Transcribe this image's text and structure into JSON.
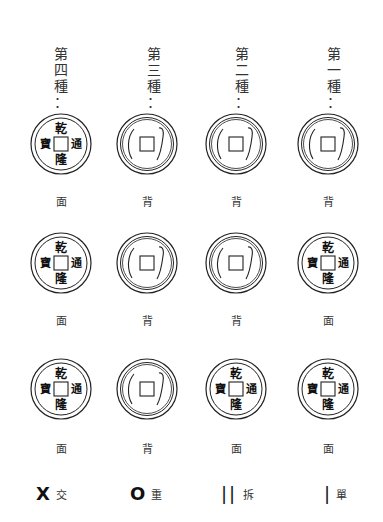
{
  "headers": [
    {
      "label": "第四種：",
      "chars": [
        "第",
        "四",
        "種",
        "："
      ]
    },
    {
      "label": "第三種：",
      "chars": [
        "第",
        "三",
        "種",
        "："
      ]
    },
    {
      "label": "第二種：",
      "chars": [
        "第",
        "二",
        "種",
        "："
      ]
    },
    {
      "label": "第一種：",
      "chars": [
        "第",
        "一",
        "種",
        "："
      ]
    }
  ],
  "coin_face_chars": {
    "top": "乾",
    "bottom": "隆",
    "left": "寶",
    "right": "通"
  },
  "rows": [
    {
      "coins": [
        {
          "type": "face",
          "label": "面"
        },
        {
          "type": "back",
          "label": "背"
        },
        {
          "type": "back",
          "label": "背"
        },
        {
          "type": "back",
          "label": "背"
        }
      ]
    },
    {
      "coins": [
        {
          "type": "face",
          "label": "面"
        },
        {
          "type": "back",
          "label": "背"
        },
        {
          "type": "back",
          "label": "背"
        },
        {
          "type": "face",
          "label": "面"
        }
      ]
    },
    {
      "coins": [
        {
          "type": "face",
          "label": "面"
        },
        {
          "type": "back",
          "label": "背"
        },
        {
          "type": "face",
          "label": "面"
        },
        {
          "type": "face",
          "label": "面"
        }
      ]
    }
  ],
  "legend": [
    {
      "symbol": "X",
      "label": "交"
    },
    {
      "symbol": "O",
      "label": "重"
    },
    {
      "symbol": "||",
      "label": "拆"
    },
    {
      "symbol": "|",
      "label": "單"
    }
  ]
}
